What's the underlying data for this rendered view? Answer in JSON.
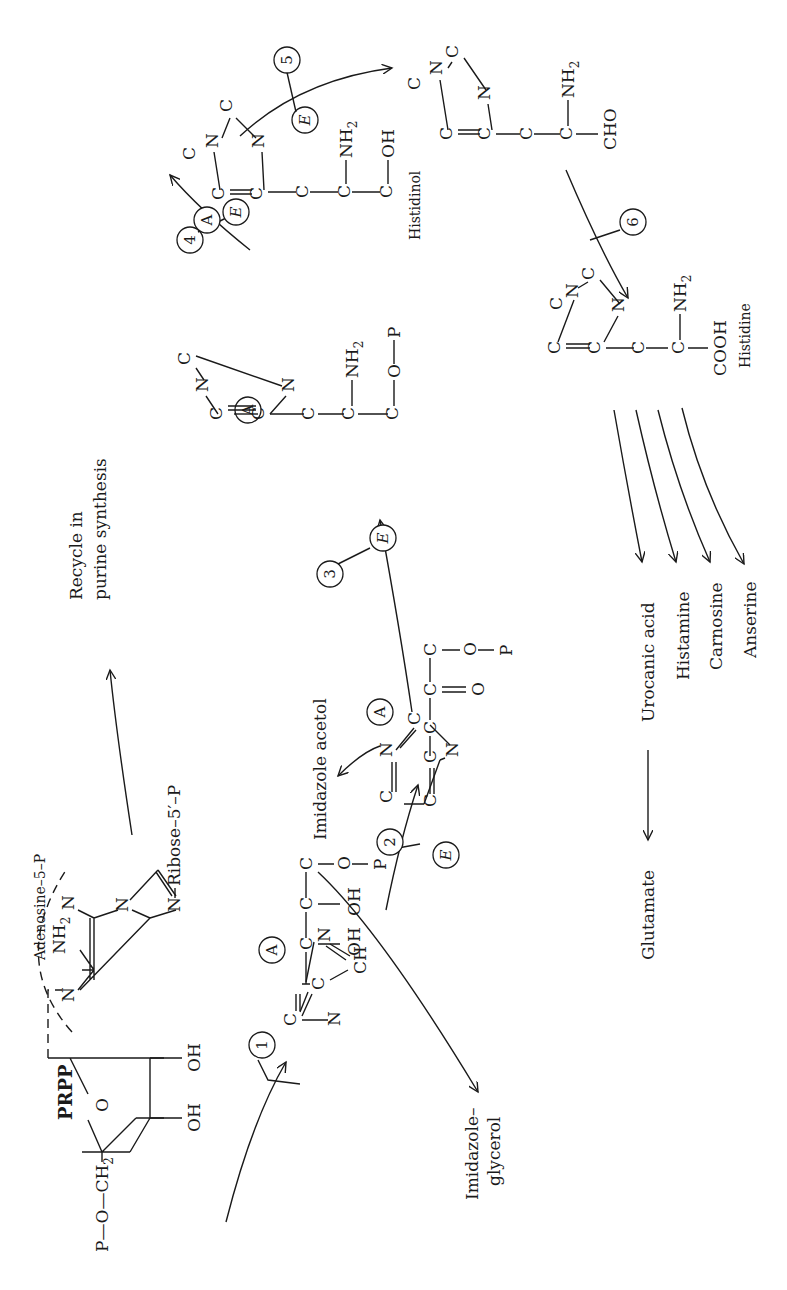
{
  "start": {
    "label": "PRPP",
    "chain": "P—O—CH",
    "chain_sub": "2",
    "ribose_O": "O",
    "oh1": "OH",
    "oh2": "OH",
    "adenosine_label": "Adenosine–5–P",
    "nh2": "NH",
    "nh2_sub": "2",
    "n": "N",
    "ribose_label": "Ribose–5′–P",
    "recycle_line1": "Recycle in",
    "recycle_line2": "purine synthesis"
  },
  "atoms": {
    "C": "C",
    "N": "N",
    "CH": "CH",
    "O": "O",
    "OH": "OH",
    "P": "P",
    "NH": "NH",
    "sub2": "2",
    "CHO": "CHO",
    "COOH": "COOH"
  },
  "markers": {
    "A": "A",
    "E": "E"
  },
  "steps": [
    {
      "num": "1",
      "enzyme": false
    },
    {
      "num": "2",
      "enzyme": true
    },
    {
      "num": "3",
      "enzyme": true
    },
    {
      "num": "4",
      "enzyme": true
    },
    {
      "num": "5",
      "enzyme": true
    },
    {
      "num": "6",
      "enzyme": false
    }
  ],
  "intermediates": {
    "imidazole_glycerol_p": {
      "byproduct_line1": "Imidazole–",
      "byproduct_line2": "glycerol"
    },
    "imidazole_acetol_p": {
      "byproduct": "Imidazole acetol"
    },
    "histidinol": {
      "label": "Histidinol"
    },
    "histidine": {
      "label": "Histidine"
    }
  },
  "products": [
    {
      "label": "Urocanic acid"
    },
    {
      "label": "Histamine"
    },
    {
      "label": "Carnosine"
    },
    {
      "label": "Anserine"
    }
  ],
  "final_product": {
    "label": "Glutamate"
  }
}
